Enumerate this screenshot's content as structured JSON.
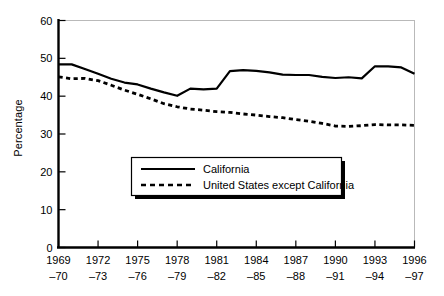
{
  "chart_data": {
    "type": "line",
    "title": "",
    "xlabel": "",
    "ylabel": "Percentage",
    "ylim": [
      0,
      60
    ],
    "yticks": [
      0,
      10,
      20,
      30,
      40,
      50,
      60
    ],
    "ytick_labels": [
      "0",
      "10",
      "20",
      "30",
      "40",
      "50",
      "60"
    ],
    "grid": false,
    "legend_position": "center",
    "x": [
      "1969-70",
      "1970-71",
      "1971-72",
      "1972-73",
      "1973-74",
      "1974-75",
      "1975-76",
      "1976-77",
      "1977-78",
      "1978-79",
      "1979-80",
      "1980-81",
      "1981-82",
      "1982-83",
      "1983-84",
      "1984-85",
      "1985-86",
      "1986-87",
      "1987-88",
      "1988-89",
      "1989-90",
      "1990-91",
      "1991-92",
      "1992-93",
      "1993-94",
      "1994-95",
      "1995-96",
      "1996-97"
    ],
    "xtick_labels_top": [
      "1969",
      "1972",
      "1975",
      "1978",
      "1981",
      "1984",
      "1987",
      "1990",
      "1993",
      "1996"
    ],
    "xtick_labels_bottom": [
      "–70",
      "–73",
      "–76",
      "–79",
      "–82",
      "–85",
      "–88",
      "–91",
      "–94",
      "–97"
    ],
    "xtick_indices": [
      0,
      3,
      6,
      9,
      12,
      15,
      18,
      21,
      24,
      27
    ],
    "series": [
      {
        "name": "California",
        "style": "solid",
        "color": "#000000",
        "values": [
          48.4,
          48.4,
          47.2,
          45.9,
          44.6,
          43.6,
          43.1,
          42.0,
          41.0,
          40.1,
          42.0,
          41.8,
          42.0,
          46.6,
          46.9,
          46.7,
          46.3,
          45.7,
          45.6,
          45.6,
          45.1,
          44.8,
          45.0,
          44.7,
          47.9,
          47.9,
          47.6,
          45.9
        ]
      },
      {
        "name": "United States except California",
        "style": "dashed",
        "color": "#000000",
        "values": [
          45.1,
          44.6,
          44.7,
          44.1,
          42.9,
          41.6,
          40.5,
          39.3,
          38.0,
          37.2,
          36.6,
          36.3,
          35.9,
          35.7,
          35.3,
          35.0,
          34.6,
          34.3,
          33.8,
          33.4,
          32.8,
          32.1,
          32.0,
          32.2,
          32.5,
          32.4,
          32.4,
          32.3
        ]
      }
    ]
  },
  "legend": {
    "entries": [
      {
        "label": "California",
        "style": "solid"
      },
      {
        "label": "United States except California",
        "style": "dashed"
      }
    ]
  }
}
